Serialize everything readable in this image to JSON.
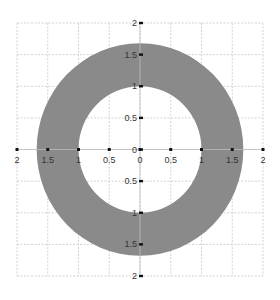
{
  "chart_data": {
    "type": "area",
    "title": "",
    "xlabel": "",
    "ylabel": "",
    "xlim": [
      -2,
      2
    ],
    "ylim": [
      -2,
      2
    ],
    "grid": true,
    "grid_step": 0.5,
    "shape": "annulus",
    "center": [
      0,
      0
    ],
    "inner_radius": 1.0,
    "outer_radius": 1.68,
    "x_tick_labels": [
      "2",
      "1.5",
      "1",
      "0.5",
      "0",
      "0.5",
      "1",
      "1.5",
      "2"
    ],
    "x_tick_values": [
      -2,
      -1.5,
      -1,
      -0.5,
      0,
      0.5,
      1,
      1.5,
      2
    ],
    "y_tick_labels": [
      "2",
      "1.5",
      "1",
      "0.5",
      "0",
      "0.5",
      "1",
      "1.5",
      "2"
    ],
    "y_tick_values": [
      2,
      1.5,
      1,
      0.5,
      0,
      -0.5,
      -1,
      -1.5,
      -2
    ],
    "legend": []
  },
  "colors": {
    "fill": "#8a8a8a",
    "grid": "#c8c8c8",
    "axis": "#bbbbbb",
    "tick": "#111111",
    "label": "#333333"
  }
}
